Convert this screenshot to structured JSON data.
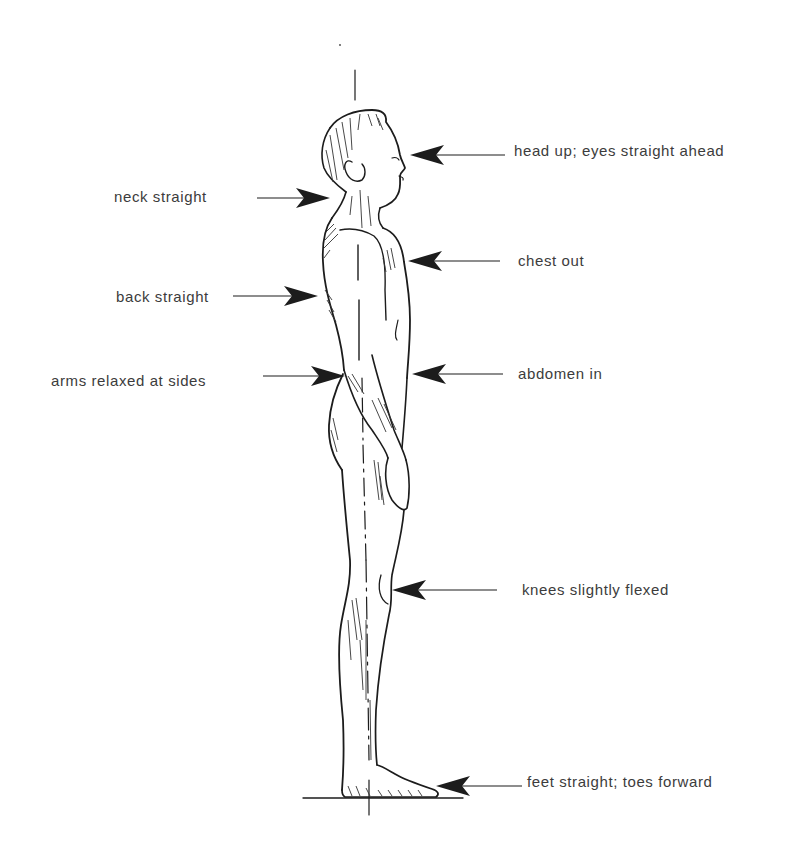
{
  "diagram": {
    "figure": "human-figure-side-profile",
    "reference_line": "vertical-plumb-line",
    "ground_line": "floor-line"
  },
  "labels": [
    {
      "id": "head",
      "text": "head up; eyes straight ahead",
      "side": "right",
      "x": 514,
      "y": 142
    },
    {
      "id": "neck",
      "text": "neck straight",
      "side": "left",
      "x": 114,
      "y": 188
    },
    {
      "id": "chest",
      "text": "chest out",
      "side": "right",
      "x": 518,
      "y": 252
    },
    {
      "id": "back",
      "text": "back straight",
      "side": "left",
      "x": 116,
      "y": 288
    },
    {
      "id": "arms",
      "text": "arms relaxed at sides",
      "side": "left",
      "x": 51,
      "y": 372
    },
    {
      "id": "abdomen",
      "text": "abdomen in",
      "side": "right",
      "x": 518,
      "y": 365
    },
    {
      "id": "knees",
      "text": "knees slightly flexed",
      "side": "right",
      "x": 522,
      "y": 581
    },
    {
      "id": "feet",
      "text": "feet straight; toes forward",
      "side": "right",
      "x": 527,
      "y": 773
    }
  ],
  "arrows": [
    {
      "id": "head",
      "direction": "left",
      "tail_x": 505,
      "tip_x": 410,
      "y": 155
    },
    {
      "id": "neck",
      "direction": "right",
      "tail_x": 257,
      "tip_x": 330,
      "y": 198
    },
    {
      "id": "chest",
      "direction": "left",
      "tail_x": 500,
      "tip_x": 408,
      "y": 261
    },
    {
      "id": "back",
      "direction": "right",
      "tail_x": 233,
      "tip_x": 318,
      "y": 296
    },
    {
      "id": "arms",
      "direction": "right",
      "tail_x": 263,
      "tip_x": 345,
      "y": 376
    },
    {
      "id": "abdomen",
      "direction": "left",
      "tail_x": 503,
      "tip_x": 412,
      "y": 374
    },
    {
      "id": "knees",
      "direction": "left",
      "tail_x": 497,
      "tip_x": 392,
      "y": 590
    },
    {
      "id": "feet",
      "direction": "left",
      "tail_x": 522,
      "tip_x": 436,
      "y": 786
    }
  ],
  "colors": {
    "ink": "#1c1c1c",
    "text": "#3c3c3c",
    "background": "#ffffff"
  }
}
